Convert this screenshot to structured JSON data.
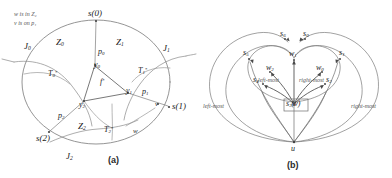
{
  "figure": {
    "panels": [
      {
        "id": "a",
        "caption": "(a)",
        "annotations": [
          {
            "name": "note-w-in-z2",
            "text": "w is in Z₂"
          },
          {
            "name": "note-v-on-p1",
            "text": "v is on p₁"
          }
        ],
        "boundary_points": [
          {
            "name": "s0",
            "base": "s",
            "arg": "(0)",
            "text": "s(0)"
          },
          {
            "name": "s1",
            "base": "s",
            "arg": "(1)",
            "text": "s(1)"
          },
          {
            "name": "s2",
            "base": "s",
            "arg": "(2)",
            "text": "s(2)"
          }
        ],
        "regions": [
          {
            "name": "z0",
            "base": "Z",
            "sub": "0"
          },
          {
            "name": "z1",
            "base": "Z",
            "sub": "1"
          },
          {
            "name": "z2",
            "base": "Z",
            "sub": "2"
          }
        ],
        "arcs": [
          {
            "name": "j0",
            "base": "J",
            "sub": "0"
          },
          {
            "name": "j1",
            "base": "J",
            "sub": "1"
          },
          {
            "name": "j2",
            "base": "J",
            "sub": "2"
          }
        ],
        "trees": [
          {
            "name": "t0",
            "base": "T",
            "sub": "0",
            "sup": "*"
          },
          {
            "name": "t1",
            "base": "T",
            "sub": "1",
            "sup": "*"
          },
          {
            "name": "t2",
            "base": "T",
            "sub": "2",
            "sup": "*"
          }
        ],
        "paths": [
          {
            "name": "p0",
            "base": "p",
            "sub": "0"
          },
          {
            "name": "p1",
            "base": "p",
            "sub": "1"
          },
          {
            "name": "p2",
            "base": "p",
            "sub": "2"
          }
        ],
        "vertices": [
          {
            "name": "y0",
            "base": "y",
            "sub": "0"
          },
          {
            "name": "y1",
            "base": "y",
            "sub": "1"
          },
          {
            "name": "y2",
            "base": "y",
            "sub": "2"
          }
        ],
        "center_label": {
          "name": "f-star",
          "base": "f",
          "sup": "*"
        },
        "extra_points": [
          {
            "name": "v",
            "text": "v"
          },
          {
            "name": "w",
            "text": "w"
          }
        ]
      },
      {
        "id": "b",
        "caption": "(b)",
        "root": {
          "name": "u",
          "text": "u"
        },
        "center_node": {
          "name": "s3-v",
          "base": "s",
          "sub": "3",
          "suffix": "(v)"
        },
        "s_nodes": [
          {
            "name": "s0",
            "base": "s",
            "sub": "0"
          },
          {
            "name": "s1",
            "base": "s",
            "sub": "1"
          },
          {
            "name": "s2",
            "base": "s",
            "sub": "2"
          },
          {
            "name": "s4",
            "base": "s",
            "sub": "4"
          },
          {
            "name": "s5",
            "base": "s",
            "sub": "5"
          },
          {
            "name": "s6",
            "base": "s",
            "sub": "6"
          }
        ],
        "w_nodes": [
          {
            "name": "w0",
            "base": "w",
            "sub": "0"
          },
          {
            "name": "w1",
            "base": "w",
            "sub": "1"
          },
          {
            "name": "w2",
            "base": "w",
            "sub": "2"
          }
        ],
        "side_labels": [
          {
            "name": "inner-left-most",
            "text": "left-most"
          },
          {
            "name": "inner-right-most",
            "text": "right-most"
          },
          {
            "name": "outer-left-most",
            "text": "left-most"
          },
          {
            "name": "outer-right-most",
            "text": "right-most"
          }
        ]
      }
    ],
    "colors": {
      "ink": "#2b2b2b",
      "light_ink": "#6f6f6f",
      "background": "#ffffff"
    }
  }
}
